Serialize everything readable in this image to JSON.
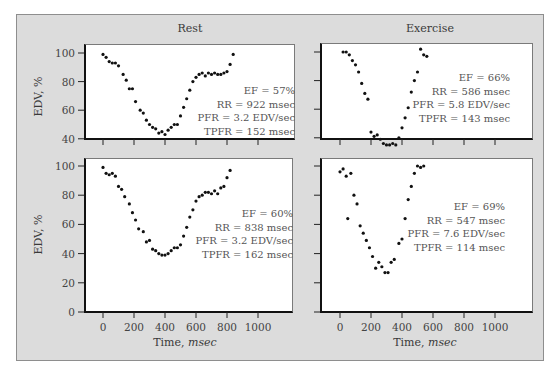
{
  "figure": {
    "columns": [
      "Rest",
      "Exercise"
    ],
    "y_axis_label": "EDV, %",
    "x_axis_label_prefix": "Time, ",
    "x_axis_label_unit": "msec"
  },
  "colors": {
    "frame_background": "#dcdcdc",
    "plot_background": "#ffffff",
    "points": "#111111",
    "text": "#3a3a3a"
  },
  "panels": [
    {
      "id": "rest-top",
      "column": "Rest",
      "stats": [
        "EF = 57%",
        "RR = 922 msec",
        "PFR = 3.2 EDV/sec",
        "TPFR = 152 msec"
      ]
    },
    {
      "id": "exercise-top",
      "column": "Exercise",
      "stats": [
        "EF = 66%",
        "RR = 586 msec",
        "PFR = 5.8 EDV/sec",
        "TPFR = 143 msec"
      ]
    },
    {
      "id": "rest-bottom",
      "column": "Rest",
      "stats": [
        "EF = 60%",
        "RR = 838 msec",
        "PFR = 3.2 EDV/sec",
        "TPFR = 162 msec"
      ]
    },
    {
      "id": "exercise-bottom",
      "column": "Exercise",
      "stats": [
        "EF = 69%",
        "RR = 547 msec",
        "PFR = 7.6 EDV/sec",
        "TPFR = 114 msec"
      ]
    }
  ],
  "chart_data": [
    {
      "type": "scatter",
      "title": "Rest",
      "xlabel": "Time, msec",
      "ylabel": "EDV, %",
      "xlim": [
        -60,
        1200
      ],
      "ylim": [
        40,
        105
      ],
      "yticks": [
        40,
        60,
        80,
        100
      ],
      "xticks": [
        0,
        200,
        400,
        600,
        800,
        1000
      ],
      "annotations": [
        "EF = 57%",
        "RR = 922 msec",
        "PFR = 3.2 EDV/sec",
        "TPFR = 152 msec"
      ],
      "x": [
        0,
        20,
        40,
        60,
        80,
        100,
        130,
        150,
        170,
        190,
        210,
        240,
        260,
        280,
        300,
        320,
        340,
        360,
        380,
        400,
        420,
        440,
        460,
        480,
        500,
        520,
        540,
        560,
        580,
        600,
        620,
        640,
        660,
        680,
        700,
        720,
        740,
        760,
        780,
        800,
        820,
        840
      ],
      "y": [
        99,
        97,
        94,
        93,
        93,
        91,
        85,
        81,
        75,
        75,
        66,
        60,
        58,
        53,
        50,
        48,
        47,
        44,
        45,
        43,
        46,
        48,
        50,
        50,
        56,
        62,
        68,
        74,
        80,
        83,
        85,
        86,
        84,
        86,
        85,
        86,
        85,
        85,
        86,
        87,
        92,
        99
      ]
    },
    {
      "type": "scatter",
      "title": "Exercise",
      "xlabel": "Time, msec",
      "ylabel": "EDV, %",
      "xlim": [
        -60,
        1200
      ],
      "ylim": [
        40,
        105
      ],
      "yticks": [
        40,
        60,
        80,
        100
      ],
      "xticks": [
        0,
        200,
        400,
        600,
        800,
        1000
      ],
      "annotations": [
        "EF = 66%",
        "RR = 586 msec",
        "PFR = 5.8 EDV/sec",
        "TPFR = 143 msec"
      ],
      "x": [
        20,
        40,
        60,
        80,
        100,
        120,
        140,
        160,
        180,
        200,
        220,
        240,
        260,
        280,
        300,
        320,
        340,
        360,
        380,
        400,
        420,
        440,
        460,
        480,
        500,
        520,
        540,
        560
      ],
      "y": [
        100,
        100,
        98,
        94,
        91,
        86,
        78,
        71,
        67,
        44,
        41,
        42,
        39,
        36,
        35,
        35,
        36,
        35,
        40,
        47,
        54,
        61,
        72,
        80,
        86,
        102,
        98,
        97
      ]
    },
    {
      "type": "scatter",
      "title": "Rest",
      "xlabel": "Time, msec",
      "ylabel": "EDV, %",
      "xlim": [
        -60,
        1200
      ],
      "ylim": [
        0,
        105
      ],
      "yticks": [
        0,
        20,
        40,
        60,
        80,
        100
      ],
      "xticks": [
        0,
        200,
        400,
        600,
        800,
        1000
      ],
      "annotations": [
        "EF = 60%",
        "RR = 838 msec",
        "PFR = 3.2 EDV/sec",
        "TPFR = 162 msec"
      ],
      "x": [
        0,
        20,
        40,
        60,
        80,
        100,
        120,
        140,
        170,
        190,
        210,
        230,
        260,
        280,
        300,
        320,
        340,
        360,
        380,
        400,
        420,
        440,
        460,
        480,
        500,
        520,
        540,
        560,
        580,
        600,
        620,
        640,
        660,
        680,
        700,
        720,
        740,
        760,
        780,
        800,
        820
      ],
      "y": [
        99,
        95,
        94,
        95,
        93,
        86,
        84,
        79,
        74,
        68,
        63,
        57,
        55,
        48,
        49,
        43,
        42,
        40,
        39,
        39,
        40,
        42,
        44,
        44,
        46,
        52,
        58,
        65,
        70,
        76,
        79,
        80,
        82,
        82,
        81,
        83,
        81,
        85,
        86,
        92,
        97
      ]
    },
    {
      "type": "scatter",
      "title": "Exercise",
      "xlabel": "Time, msec",
      "ylabel": "EDV, %",
      "xlim": [
        -60,
        1200
      ],
      "ylim": [
        0,
        105
      ],
      "yticks": [
        0,
        20,
        40,
        60,
        80,
        100
      ],
      "xticks": [
        0,
        200,
        400,
        600,
        800,
        1000
      ],
      "annotations": [
        "EF = 69%",
        "RR = 547 msec",
        "PFR = 7.6 EDV/sec",
        "TPFR = 114 msec"
      ],
      "x": [
        0,
        20,
        40,
        50,
        70,
        90,
        110,
        130,
        150,
        170,
        190,
        210,
        230,
        250,
        270,
        290,
        310,
        330,
        350,
        380,
        400,
        420,
        440,
        460,
        480,
        500,
        520,
        540
      ],
      "y": [
        96,
        98,
        93,
        64,
        95,
        80,
        74,
        59,
        54,
        49,
        44,
        38,
        30,
        34,
        31,
        27,
        27,
        34,
        36,
        47,
        50,
        64,
        77,
        86,
        95,
        100,
        99,
        100
      ]
    }
  ]
}
